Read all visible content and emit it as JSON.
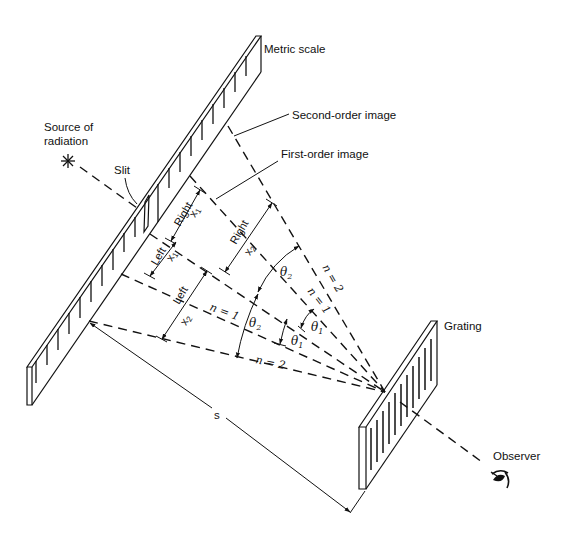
{
  "diagram": {
    "labels": {
      "metric_scale": "Metric scale",
      "source_line1": "Source of",
      "source_line2": "radiation",
      "slit": "Slit",
      "second_order_image": "Second-order image",
      "first_order_image": "First-order image",
      "grating": "Grating",
      "observer": "Observer",
      "distance": "s"
    },
    "dimensions": {
      "right_x1": {
        "side": "Right",
        "var": "x",
        "sub": "1"
      },
      "left_x1": {
        "side": "Left",
        "var": "x",
        "sub": "1"
      },
      "right_x2": {
        "side": "Right",
        "var": "x",
        "sub": "2"
      },
      "left_x2": {
        "side": "Left",
        "var": "x",
        "sub": "2"
      }
    },
    "angles": {
      "theta2_upper": {
        "sym": "θ",
        "sub": "2"
      },
      "theta2_lower": {
        "sym": "θ",
        "sub": "2"
      },
      "theta1_upper": {
        "sym": "θ",
        "sub": "1"
      },
      "theta1_lower": {
        "sym": "θ",
        "sub": "1"
      }
    },
    "orders": {
      "upper_n2": "n = 2",
      "upper_n1": "n = 1",
      "lower_n1": "n = 1",
      "lower_n2": "n = 2"
    },
    "icons": {
      "source": "asterisk-star",
      "observer": "eye"
    }
  }
}
